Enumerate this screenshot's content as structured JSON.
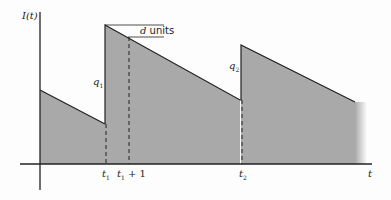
{
  "diagram": {
    "type": "inventory-level-sawtooth",
    "y_axis_label": "I(t)",
    "x_axis_label": "t",
    "annotations": {
      "d_label_var": "d",
      "d_label_units": "units",
      "q1_var": "q",
      "q1_sub": "1",
      "q2_var": "q",
      "q2_sub": "2"
    },
    "x_ticks": {
      "t1_var": "t",
      "t1_sub": "1",
      "t1p1_var": "t",
      "t1p1_sub": "1",
      "t1p1_suffix": "+ 1",
      "t2_var": "t",
      "t2_sub": "2"
    },
    "colors": {
      "fill": "#a9a9a9",
      "line": "#222222",
      "background": "#fdfdfd"
    }
  }
}
